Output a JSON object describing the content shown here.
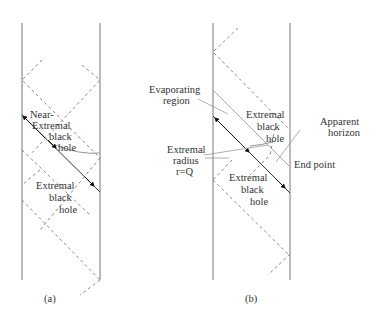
{
  "panel_a": {
    "caption": "(a)",
    "labels": {
      "near_extremal_line1": "Near-",
      "near_extremal_line2": "Extremal",
      "near_extremal_line3": "black",
      "near_extremal_line4": "hole",
      "extremal_line1": "Extremal",
      "extremal_line2": "black",
      "extremal_line3": "hole"
    }
  },
  "panel_b": {
    "caption": "(b)",
    "labels": {
      "evaporating_line1": "Evaporating",
      "evaporating_line2": "region",
      "extremal_top_line1": "Extremal",
      "extremal_top_line2": "black",
      "extremal_top_line3": "hole",
      "apparent_line1": "Apparent",
      "apparent_line2": "horizon",
      "radius_line1": "Extremal",
      "radius_line2": "radius",
      "radius_line3": "r=Q",
      "end_point": "End point",
      "extremal_bottom_line1": "Extremal",
      "extremal_bottom_line2": "black",
      "extremal_bottom_line3": "hole"
    }
  },
  "colors": {
    "line": "#555555",
    "dashed": "#888888",
    "arrow": "#111111"
  }
}
